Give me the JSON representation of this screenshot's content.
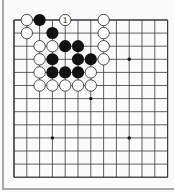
{
  "diagram": {
    "type": "go-board-partial",
    "view": {
      "columns": 13,
      "rows": 13,
      "origin_x": 14,
      "origin_y": 20,
      "spacing_x": 12.8,
      "spacing_y": 13.1,
      "edges": [
        "top",
        "left"
      ]
    },
    "colors": {
      "background": "#fbfbfb",
      "grid_line": "#3a3a3a",
      "frame": "#a8a8a8",
      "black_stone": "#111111",
      "white_stone_fill": "#ffffff",
      "white_stone_stroke": "#222222"
    },
    "star_points": [
      {
        "col": 9,
        "row": 3
      },
      {
        "col": 6,
        "row": 6
      },
      {
        "col": 3,
        "row": 9
      },
      {
        "col": 9,
        "row": 9
      }
    ],
    "stones": [
      {
        "col": 1,
        "row": 0,
        "color": "white"
      },
      {
        "col": 2,
        "row": 0,
        "color": "black"
      },
      {
        "col": 4,
        "row": 0,
        "color": "white",
        "label": "1"
      },
      {
        "col": 7,
        "row": 0,
        "color": "white"
      },
      {
        "col": 1,
        "row": 1,
        "color": "white"
      },
      {
        "col": 3,
        "row": 1,
        "color": "black"
      },
      {
        "col": 7,
        "row": 1,
        "color": "white"
      },
      {
        "col": 2,
        "row": 2,
        "color": "white"
      },
      {
        "col": 3,
        "row": 2,
        "color": "white"
      },
      {
        "col": 4,
        "row": 2,
        "color": "black"
      },
      {
        "col": 5,
        "row": 2,
        "color": "black"
      },
      {
        "col": 7,
        "row": 2,
        "color": "white"
      },
      {
        "col": 2,
        "row": 3,
        "color": "white"
      },
      {
        "col": 3,
        "row": 3,
        "color": "black"
      },
      {
        "col": 5,
        "row": 3,
        "color": "black"
      },
      {
        "col": 6,
        "row": 3,
        "color": "black"
      },
      {
        "col": 7,
        "row": 3,
        "color": "white"
      },
      {
        "col": 2,
        "row": 4,
        "color": "white"
      },
      {
        "col": 3,
        "row": 4,
        "color": "black"
      },
      {
        "col": 4,
        "row": 4,
        "color": "black"
      },
      {
        "col": 5,
        "row": 4,
        "color": "black"
      },
      {
        "col": 6,
        "row": 4,
        "color": "white"
      },
      {
        "col": 2,
        "row": 5,
        "color": "white"
      },
      {
        "col": 3,
        "row": 5,
        "color": "white"
      },
      {
        "col": 4,
        "row": 5,
        "color": "white"
      },
      {
        "col": 5,
        "row": 5,
        "color": "white"
      },
      {
        "col": 6,
        "row": 5,
        "color": "white"
      }
    ],
    "move_labels": [
      {
        "number": "1",
        "col": 4,
        "row": 0,
        "on": "white"
      }
    ]
  }
}
